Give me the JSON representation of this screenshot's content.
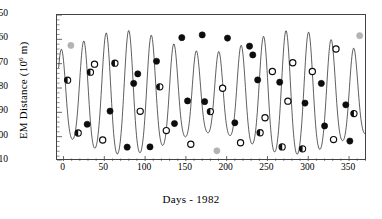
{
  "chart_data": {
    "type": "line",
    "title": "",
    "subtitle": "",
    "xlabel": "Days - 1982",
    "ylabel": "EM Distance (10^6 m)",
    "ylabel_text": "EM Distance (10",
    "ylabel_sup": "6",
    "ylabel_tail": " m)",
    "xlim": [
      -8,
      372
    ],
    "ylim": [
      410,
      350
    ],
    "y_inverted": true,
    "grid": false,
    "legend": "none",
    "xticks": [
      0,
      50,
      100,
      150,
      200,
      250,
      300,
      350
    ],
    "xtick_labels": [
      "0",
      "50",
      "100",
      "150",
      "200",
      "250",
      "300",
      "350"
    ],
    "x_minor_step": 10,
    "yticks": [
      350,
      360,
      370,
      380,
      390,
      400,
      410
    ],
    "ytick_labels": [
      "350",
      "360",
      "370",
      "380",
      "390",
      "400",
      "410"
    ],
    "y_minor_step": 2,
    "curve_description": "Earth-Moon distance over 1982; anomalistic cycle of about 27.55 days with daily sawtooth ripple",
    "anomalistic_period_days": 27.55,
    "curve_mean": 384.4,
    "curve_amplitude": 21.0,
    "series": [
      {
        "name": "observations",
        "marker_types": [
          "filled",
          "half-filled",
          "open",
          "gray"
        ],
        "points": [
          {
            "x": 5,
            "y": 376.8,
            "marker": "half-filled"
          },
          {
            "x": 9,
            "y": 362.5,
            "marker": "gray"
          },
          {
            "x": 18,
            "y": 398.5,
            "marker": "half-filled"
          },
          {
            "x": 29,
            "y": 394.9,
            "marker": "filled"
          },
          {
            "x": 33,
            "y": 373.5,
            "marker": "half-filled"
          },
          {
            "x": 38,
            "y": 370.2,
            "marker": "open"
          },
          {
            "x": 48,
            "y": 401.4,
            "marker": "open"
          },
          {
            "x": 57,
            "y": 389.5,
            "marker": "filled"
          },
          {
            "x": 63,
            "y": 369.8,
            "marker": "half-filled"
          },
          {
            "x": 78,
            "y": 404.3,
            "marker": "filled"
          },
          {
            "x": 86,
            "y": 378.1,
            "marker": "filled"
          },
          {
            "x": 91,
            "y": 374.2,
            "marker": "filled"
          },
          {
            "x": 94,
            "y": 389.6,
            "marker": "open"
          },
          {
            "x": 106,
            "y": 404.2,
            "marker": "filled"
          },
          {
            "x": 114,
            "y": 369.0,
            "marker": "filled"
          },
          {
            "x": 118,
            "y": 379.5,
            "marker": "half-filled"
          },
          {
            "x": 126,
            "y": 397.5,
            "marker": "open"
          },
          {
            "x": 136,
            "y": 394.6,
            "marker": "filled"
          },
          {
            "x": 145,
            "y": 359.3,
            "marker": "filled"
          },
          {
            "x": 152,
            "y": 385.3,
            "marker": "filled"
          },
          {
            "x": 156,
            "y": 403.1,
            "marker": "open"
          },
          {
            "x": 170,
            "y": 358.2,
            "marker": "filled"
          },
          {
            "x": 173,
            "y": 385.6,
            "marker": "filled"
          },
          {
            "x": 180,
            "y": 389.7,
            "marker": "half-filled"
          },
          {
            "x": 188,
            "y": 405.8,
            "marker": "gray"
          },
          {
            "x": 195,
            "y": 380.1,
            "marker": "open"
          },
          {
            "x": 201,
            "y": 359.5,
            "marker": "filled"
          },
          {
            "x": 210,
            "y": 394.3,
            "marker": "filled"
          },
          {
            "x": 217,
            "y": 402.5,
            "marker": "open"
          },
          {
            "x": 228,
            "y": 362.8,
            "marker": "filled"
          },
          {
            "x": 232,
            "y": 366.4,
            "marker": "filled"
          },
          {
            "x": 238,
            "y": 376.7,
            "marker": "filled"
          },
          {
            "x": 241,
            "y": 398.4,
            "marker": "half-filled"
          },
          {
            "x": 247,
            "y": 392.2,
            "marker": "open"
          },
          {
            "x": 256,
            "y": 373.2,
            "marker": "open"
          },
          {
            "x": 265,
            "y": 377.6,
            "marker": "filled"
          },
          {
            "x": 268,
            "y": 404.2,
            "marker": "half-filled"
          },
          {
            "x": 275,
            "y": 385.4,
            "marker": "open"
          },
          {
            "x": 281,
            "y": 369.6,
            "marker": "open"
          },
          {
            "x": 293,
            "y": 405.0,
            "marker": "half-filled"
          },
          {
            "x": 296,
            "y": 386.2,
            "marker": "filled"
          },
          {
            "x": 305,
            "y": 373.2,
            "marker": "open"
          },
          {
            "x": 316,
            "y": 378.1,
            "marker": "filled"
          },
          {
            "x": 320,
            "y": 395.6,
            "marker": "filled"
          },
          {
            "x": 331,
            "y": 401.2,
            "marker": "open"
          },
          {
            "x": 334,
            "y": 364.0,
            "marker": "open"
          },
          {
            "x": 346,
            "y": 386.9,
            "marker": "filled"
          },
          {
            "x": 351,
            "y": 401.8,
            "marker": "filled"
          },
          {
            "x": 356,
            "y": 390.5,
            "marker": "half-filled"
          },
          {
            "x": 363,
            "y": 358.5,
            "marker": "gray"
          }
        ]
      }
    ],
    "colors": {
      "line": "#1a1a1a",
      "axis": "#444444",
      "marker_filled": "#0d0d0d",
      "marker_open": "#ffffff",
      "marker_gray": "#b3b3b3",
      "marker_edge": "#0d0d0d",
      "background": "#ffffff"
    }
  }
}
